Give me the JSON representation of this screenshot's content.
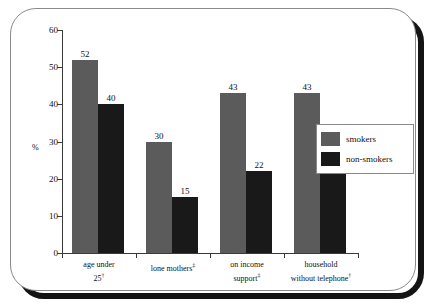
{
  "chart_data": {
    "type": "bar",
    "title": "",
    "xlabel": "",
    "ylabel": "%",
    "ylim": [
      0,
      60
    ],
    "yticks": [
      0,
      10,
      20,
      30,
      40,
      50,
      60
    ],
    "grid": false,
    "legend_position": "right",
    "categories": [
      "age under 25",
      "lone mothers",
      "on income support",
      "household without telephone"
    ],
    "category_labels": [
      {
        "line1": "age under",
        "line2": "25",
        "footnote": "†"
      },
      {
        "line1": "lone mothers",
        "line2": "",
        "footnote": "‡"
      },
      {
        "line1": "on income",
        "line2": "support",
        "footnote": "‡"
      },
      {
        "line1": "household",
        "line2": "without telephone",
        "footnote": "†"
      }
    ],
    "series": [
      {
        "name": "smokers",
        "color": "#5b5b5b",
        "values": [
          52,
          30,
          43,
          43
        ]
      },
      {
        "name": "non-smokers",
        "color": "#191919",
        "values": [
          40,
          15,
          22,
          23
        ]
      }
    ]
  },
  "legend": {
    "items": [
      {
        "label": "smokers"
      },
      {
        "label": "non-smokers"
      }
    ]
  }
}
